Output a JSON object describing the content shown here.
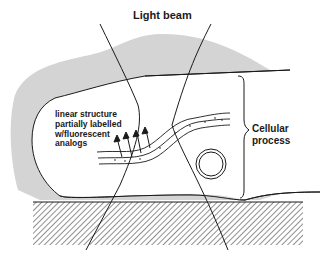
{
  "diagram": {
    "title": "Light beam",
    "annotations": {
      "linear_structure": "linear structure\npartially labelled\nw/fluorescent\nanalogs",
      "cellular_process": "Cellular\nprocess"
    },
    "colors": {
      "gray_region": "#d4d4d4",
      "lines": "#1a1a1a",
      "background": "#ffffff"
    },
    "elements": [
      "light-beam-lines",
      "cell-outline",
      "gray-cytoplasm-region",
      "linear-fiber",
      "fluorescence-arrows",
      "vesicle-circle",
      "substrate-hatched",
      "bracket"
    ]
  }
}
